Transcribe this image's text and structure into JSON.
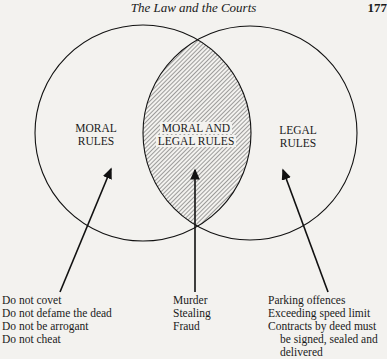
{
  "header": {
    "title": "The Law and the Courts",
    "page_number": "177"
  },
  "diagram": {
    "type": "venn",
    "circles": [
      {
        "id": "left",
        "label_lines": [
          "MORAL",
          "RULES"
        ]
      },
      {
        "id": "right",
        "label_lines": [
          "LEGAL",
          "RULES"
        ]
      }
    ],
    "intersection": {
      "label_lines": [
        "MORAL AND",
        "LEGAL RULES"
      ],
      "fill": "hatched"
    },
    "examples": {
      "moral_only": [
        "Do not covet",
        "Do not defame the dead",
        "Do not be arrogant",
        "Do not cheat"
      ],
      "both": [
        "Murder",
        "Stealing",
        "Fraud"
      ],
      "legal_only": [
        "Parking offences",
        "Exceeding speed limit",
        "Contracts by deed must",
        "be signed, sealed and",
        "delivered"
      ]
    }
  }
}
